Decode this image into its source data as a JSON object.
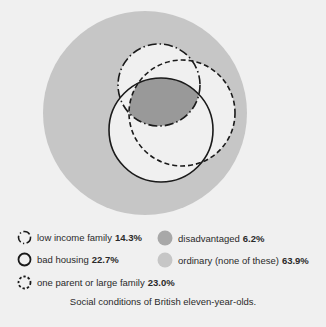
{
  "diagram": {
    "background_color": "#f0f0f0",
    "ordinary_color": "#c6c6c6",
    "disadvantaged_color": "#999999",
    "circles": {
      "ordinary": {
        "cx": 145,
        "cy": 113,
        "r": 102
      },
      "low_income": {
        "cx": 159,
        "cy": 85,
        "r": 41
      },
      "bad_housing": {
        "cx": 161,
        "cy": 130,
        "r": 52
      },
      "one_parent": {
        "cx": 182,
        "cy": 113,
        "r": 53
      }
    }
  },
  "legend": {
    "low_income": {
      "label": "low income family",
      "value": "14.3%",
      "icon": "dash-dot-circle-icon"
    },
    "bad_housing": {
      "label": "bad housing",
      "value": "22.7%",
      "icon": "solid-circle-icon"
    },
    "one_parent": {
      "label": "one parent or large family",
      "value": "23.0%",
      "icon": "dashed-circle-icon"
    },
    "disadvantaged": {
      "label": "disadvantaged",
      "value": "6.2%",
      "icon": "dark-gray-disc-icon"
    },
    "ordinary": {
      "label": "ordinary (none of these)",
      "value": "63.9%",
      "icon": "light-gray-disc-icon"
    }
  },
  "caption": "Social conditions of British eleven-year-olds."
}
